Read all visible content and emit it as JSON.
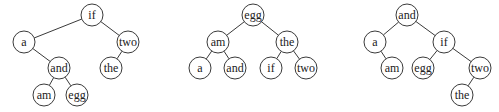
{
  "style": {
    "stroke": "#3a3a3a",
    "fill": "#ffffff",
    "text": "#222222",
    "radius": 11
  },
  "trees": [
    {
      "name": "tree-1",
      "nodes": [
        {
          "id": "if",
          "label": "if",
          "x": 92,
          "y": 15
        },
        {
          "id": "a",
          "label": "a",
          "x": 24,
          "y": 42
        },
        {
          "id": "two",
          "label": "two",
          "x": 128,
          "y": 42
        },
        {
          "id": "and",
          "label": "and",
          "x": 59,
          "y": 68
        },
        {
          "id": "the",
          "label": "the",
          "x": 111,
          "y": 68
        },
        {
          "id": "am",
          "label": "am",
          "x": 44,
          "y": 95
        },
        {
          "id": "egg",
          "label": "egg",
          "x": 77,
          "y": 95
        }
      ],
      "edges": [
        [
          "if",
          "a"
        ],
        [
          "if",
          "two"
        ],
        [
          "a",
          "and"
        ],
        [
          "two",
          "the"
        ],
        [
          "and",
          "am"
        ],
        [
          "and",
          "egg"
        ]
      ]
    },
    {
      "name": "tree-2",
      "nodes": [
        {
          "id": "egg",
          "label": "egg",
          "x": 253,
          "y": 15
        },
        {
          "id": "am",
          "label": "am",
          "x": 218,
          "y": 42
        },
        {
          "id": "the",
          "label": "the",
          "x": 287,
          "y": 42
        },
        {
          "id": "a",
          "label": "a",
          "x": 200,
          "y": 68
        },
        {
          "id": "and",
          "label": "and",
          "x": 235,
          "y": 68
        },
        {
          "id": "if",
          "label": "if",
          "x": 271,
          "y": 68
        },
        {
          "id": "two",
          "label": "two",
          "x": 306,
          "y": 68
        }
      ],
      "edges": [
        [
          "egg",
          "am"
        ],
        [
          "egg",
          "the"
        ],
        [
          "am",
          "a"
        ],
        [
          "am",
          "and"
        ],
        [
          "the",
          "if"
        ],
        [
          "the",
          "two"
        ]
      ]
    },
    {
      "name": "tree-3",
      "nodes": [
        {
          "id": "and",
          "label": "and",
          "x": 407,
          "y": 15
        },
        {
          "id": "a",
          "label": "a",
          "x": 375,
          "y": 42
        },
        {
          "id": "if",
          "label": "if",
          "x": 444,
          "y": 42
        },
        {
          "id": "am",
          "label": "am",
          "x": 392,
          "y": 68
        },
        {
          "id": "egg",
          "label": "egg",
          "x": 423,
          "y": 68
        },
        {
          "id": "two",
          "label": "two",
          "x": 480,
          "y": 68
        },
        {
          "id": "the",
          "label": "the",
          "x": 462,
          "y": 95
        }
      ],
      "edges": [
        [
          "and",
          "a"
        ],
        [
          "and",
          "if"
        ],
        [
          "a",
          "am"
        ],
        [
          "if",
          "egg"
        ],
        [
          "if",
          "two"
        ],
        [
          "two",
          "the"
        ]
      ]
    }
  ]
}
